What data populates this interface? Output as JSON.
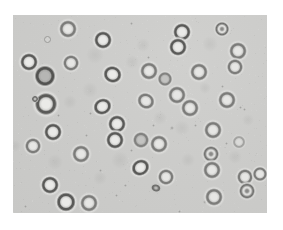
{
  "image": {
    "description": "Bright-field light micrograph of round blood cells (erythrocytes) scattered on a pale gray background, framed by a white border",
    "width": 283,
    "height": 230,
    "border_color": "#ffffff"
  },
  "micrograph": {
    "frame": {
      "left": 13,
      "top": 15,
      "width": 254,
      "height": 198
    },
    "background_color": "#cbcbc9",
    "cell_count": 42,
    "cell_types": {
      "drb": "dark ring with bright center",
      "rb": "medium ring with bright center",
      "drg": "dark ring with gray center",
      "rg": "medium ring with gray center",
      "dc": "ring with dark center dot",
      "faint": "faint out-of-focus cell",
      "sq": "small dark irregular ring"
    },
    "cells": [
      {
        "x": 68,
        "y": 29,
        "d": 15,
        "t": "rb"
      },
      {
        "x": 103,
        "y": 40,
        "d": 15,
        "t": "drb"
      },
      {
        "x": 222,
        "y": 29,
        "d": 13,
        "t": "dc"
      },
      {
        "x": 182,
        "y": 32,
        "d": 15,
        "t": "drb"
      },
      {
        "x": 178,
        "y": 47,
        "d": 15,
        "t": "drb"
      },
      {
        "x": 238,
        "y": 51,
        "d": 15,
        "t": "rb"
      },
      {
        "x": 235,
        "y": 67,
        "d": 14,
        "t": "rb"
      },
      {
        "x": 29,
        "y": 62,
        "d": 15,
        "t": "drb"
      },
      {
        "x": 71,
        "y": 63,
        "d": 14,
        "t": "rb"
      },
      {
        "x": 45,
        "y": 76,
        "d": 18,
        "t": "drg"
      },
      {
        "x": 113,
        "y": 75,
        "d": 16,
        "t": "drb",
        "rot": 20,
        "ry": 0.92
      },
      {
        "x": 149,
        "y": 71,
        "d": 15,
        "t": "rb"
      },
      {
        "x": 199,
        "y": 72,
        "d": 15,
        "t": "rb"
      },
      {
        "x": 165,
        "y": 79,
        "d": 12,
        "t": "rg"
      },
      {
        "x": 177,
        "y": 95,
        "d": 15,
        "t": "rb"
      },
      {
        "x": 46,
        "y": 104,
        "d": 19,
        "t": "drb"
      },
      {
        "x": 103,
        "y": 107,
        "d": 16,
        "t": "drb",
        "rot": -25,
        "ry": 0.88
      },
      {
        "x": 146,
        "y": 101,
        "d": 15,
        "t": "rb",
        "rot": 30,
        "ry": 0.9
      },
      {
        "x": 190,
        "y": 108,
        "d": 15,
        "t": "rb"
      },
      {
        "x": 227,
        "y": 100,
        "d": 15,
        "t": "rb"
      },
      {
        "x": 117,
        "y": 124,
        "d": 15,
        "t": "drb"
      },
      {
        "x": 115,
        "y": 140,
        "d": 15,
        "t": "drb"
      },
      {
        "x": 53,
        "y": 132,
        "d": 15,
        "t": "drb"
      },
      {
        "x": 33,
        "y": 146,
        "d": 14,
        "t": "rb"
      },
      {
        "x": 81,
        "y": 154,
        "d": 15,
        "t": "rb"
      },
      {
        "x": 141,
        "y": 140,
        "d": 14,
        "t": "rg"
      },
      {
        "x": 159,
        "y": 144,
        "d": 15,
        "t": "rb"
      },
      {
        "x": 213,
        "y": 130,
        "d": 15,
        "t": "rb"
      },
      {
        "x": 239,
        "y": 142,
        "d": 11,
        "t": "faint"
      },
      {
        "x": 211,
        "y": 154,
        "d": 14,
        "t": "dc"
      },
      {
        "x": 141,
        "y": 168,
        "d": 16,
        "t": "drb",
        "rot": -30,
        "ry": 0.88
      },
      {
        "x": 166,
        "y": 177,
        "d": 14,
        "t": "rb"
      },
      {
        "x": 212,
        "y": 170,
        "d": 15,
        "t": "rb"
      },
      {
        "x": 245,
        "y": 177,
        "d": 14,
        "t": "rb"
      },
      {
        "x": 260,
        "y": 174,
        "d": 13,
        "t": "rb"
      },
      {
        "x": 247,
        "y": 191,
        "d": 14,
        "t": "dc"
      },
      {
        "x": 50,
        "y": 185,
        "d": 15,
        "t": "drb"
      },
      {
        "x": 66,
        "y": 202,
        "d": 16,
        "t": "drb"
      },
      {
        "x": 89,
        "y": 203,
        "d": 15,
        "t": "rb"
      },
      {
        "x": 214,
        "y": 197,
        "d": 15,
        "t": "rb"
      },
      {
        "x": 156,
        "y": 188,
        "d": 8,
        "t": "sq",
        "rot": 15,
        "ry": 0.8
      },
      {
        "x": 35,
        "y": 99,
        "d": 6,
        "t": "sq"
      }
    ],
    "specks": [
      {
        "x": 46,
        "y": 38,
        "d": 5,
        "ring": true
      },
      {
        "x": 131,
        "y": 23,
        "d": 3
      },
      {
        "x": 173,
        "y": 35,
        "d": 3
      },
      {
        "x": 148,
        "y": 57,
        "d": 3
      },
      {
        "x": 222,
        "y": 86,
        "d": 3
      },
      {
        "x": 90,
        "y": 113,
        "d": 3
      },
      {
        "x": 58,
        "y": 115,
        "d": 3
      },
      {
        "x": 153,
        "y": 125,
        "d": 3
      },
      {
        "x": 172,
        "y": 128,
        "d": 4
      },
      {
        "x": 195,
        "y": 125,
        "d": 3
      },
      {
        "x": 131,
        "y": 150,
        "d": 3
      },
      {
        "x": 86,
        "y": 135,
        "d": 3
      },
      {
        "x": 240,
        "y": 107,
        "d": 3
      },
      {
        "x": 244,
        "y": 109,
        "d": 3
      },
      {
        "x": 116,
        "y": 195,
        "d": 3
      },
      {
        "x": 25,
        "y": 206,
        "d": 3
      },
      {
        "x": 179,
        "y": 211,
        "d": 3
      },
      {
        "x": 205,
        "y": 202,
        "d": 4
      },
      {
        "x": 100,
        "y": 170,
        "d": 3
      },
      {
        "x": 125,
        "y": 185,
        "d": 3
      },
      {
        "x": 226,
        "y": 143,
        "d": 3
      }
    ],
    "blobs": [
      {
        "x": 95,
        "y": 55,
        "d": 18
      },
      {
        "x": 210,
        "y": 44,
        "d": 16
      },
      {
        "x": 70,
        "y": 102,
        "d": 14
      },
      {
        "x": 182,
        "y": 128,
        "d": 16
      },
      {
        "x": 120,
        "y": 160,
        "d": 18
      },
      {
        "x": 235,
        "y": 157,
        "d": 14
      },
      {
        "x": 90,
        "y": 90,
        "d": 16
      },
      {
        "x": 160,
        "y": 118,
        "d": 14
      },
      {
        "x": 132,
        "y": 62,
        "d": 14
      },
      {
        "x": 205,
        "y": 88,
        "d": 12
      },
      {
        "x": 55,
        "y": 162,
        "d": 16
      },
      {
        "x": 143,
        "y": 45,
        "d": 14
      },
      {
        "x": 15,
        "y": 146,
        "d": 12
      },
      {
        "x": 248,
        "y": 120,
        "d": 12
      },
      {
        "x": 100,
        "y": 178,
        "d": 14
      },
      {
        "x": 188,
        "y": 160,
        "d": 14
      }
    ]
  }
}
